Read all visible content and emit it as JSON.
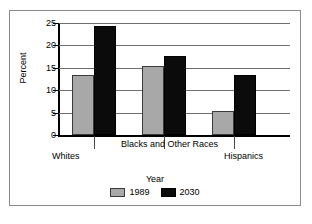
{
  "chart_data": {
    "type": "bar",
    "title": "",
    "xlabel": "Year",
    "ylabel": "Percent",
    "categories": [
      "Whites",
      "Blacks and Other Races",
      "Hispanics"
    ],
    "series": [
      {
        "name": "1989",
        "color": "#a8a8a8",
        "values": [
          13.3,
          15.3,
          5.3
        ]
      },
      {
        "name": "2030",
        "color": "#0b0b0b",
        "values": [
          24.3,
          17.6,
          13.5
        ]
      }
    ],
    "ylim": [
      0,
      25
    ],
    "ytick_values": [
      25,
      20,
      15,
      10,
      5,
      0
    ],
    "ytick_labels": [
      "25",
      "20",
      "15",
      "10",
      "5",
      "0"
    ],
    "grid": true,
    "legend_position": "bottom"
  },
  "figure": {
    "ghost_text": ""
  }
}
